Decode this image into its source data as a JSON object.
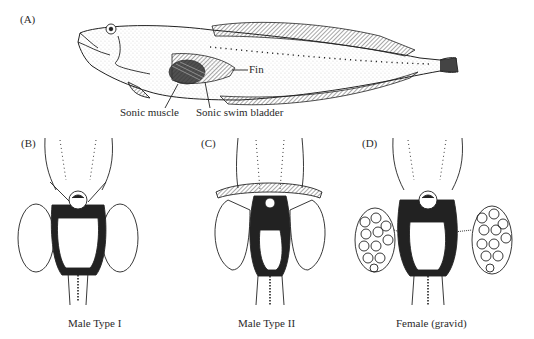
{
  "figure": {
    "panels": [
      {
        "id": "A",
        "letter": "(A)",
        "subject": "Whole fish, lateral view",
        "callouts": {
          "fin": "Fin",
          "sonic_muscle": "Sonic muscle",
          "sonic_swim_bladder": "Sonic swim bladder"
        }
      },
      {
        "id": "B",
        "letter": "(B)",
        "caption": "Male Type I"
      },
      {
        "id": "C",
        "letter": "(C)",
        "caption": "Male Type II"
      },
      {
        "id": "D",
        "letter": "(D)",
        "caption": "Female (gravid)"
      }
    ],
    "colors": {
      "ink": "#222222",
      "background": "#ffffff"
    }
  }
}
